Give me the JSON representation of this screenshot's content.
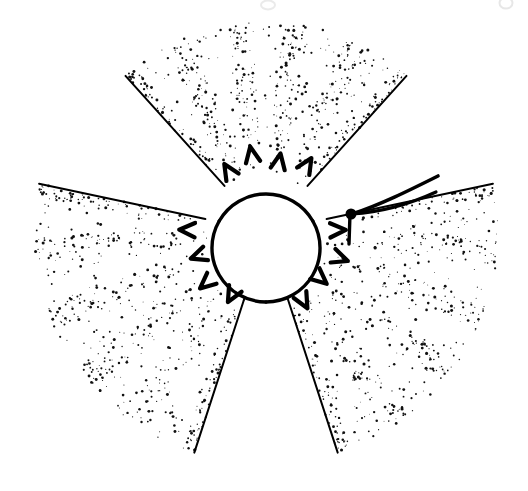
{
  "figure": {
    "domain": "Natural-Image",
    "kind": "scientific-stipple-illustration",
    "description": "Monochrome pen-and-ink stipple drawing of a radially symmetric three-lobed structure with a blank central disc, chevron markings along the inner margins of each lobe, and two slender filaments emerging at the upper right.",
    "background_color": "#ffffff",
    "ink_color": "#000000",
    "canvas": {
      "width": 528,
      "height": 491
    },
    "stipple": {
      "dot_color": "#111111",
      "dot_count": 5200,
      "min_radius": 0.45,
      "max_radius": 1.55,
      "seed": 20240517
    },
    "lobes": [
      {
        "name": "top-lobe",
        "label": "upper lobe",
        "center": [
          266,
          232
        ],
        "start_angle_deg": -132,
        "end_angle_deg": -48,
        "inner_radius": 56,
        "outer_radius": 210,
        "ray_count": 5,
        "ray_half_width_deg": 5.2,
        "corner_points": [
          [
            120,
            70
          ],
          [
            266,
            24
          ],
          [
            412,
            70
          ]
        ]
      },
      {
        "name": "left-lobe",
        "label": "lower-left lobe",
        "center": [
          266,
          232
        ],
        "start_angle_deg": 108,
        "end_angle_deg": 192,
        "inner_radius": 56,
        "outer_radius": 232,
        "ray_count": 5,
        "ray_half_width_deg": 5.2,
        "corner_points": [
          [
            42,
            156
          ],
          [
            14,
            290
          ],
          [
            186,
            452
          ]
        ]
      },
      {
        "name": "right-lobe",
        "label": "lower-right lobe",
        "center": [
          266,
          232
        ],
        "start_angle_deg": -12,
        "end_angle_deg": 72,
        "inner_radius": 56,
        "outer_radius": 232,
        "ray_count": 5,
        "ray_half_width_deg": 5.2,
        "corner_points": [
          [
            504,
            196
          ],
          [
            512,
            300
          ],
          [
            346,
            452
          ]
        ]
      }
    ],
    "central_disc": {
      "name": "central-blank-disc",
      "label": "central blank region",
      "center": [
        266,
        248
      ],
      "radius": 54,
      "fill": "#ffffff",
      "arc_stroke_width": 3.4
    },
    "boundary_arcs": [
      {
        "name": "arc-upper",
        "label": "upper boundary arc",
        "from_angle_deg": -150,
        "to_angle_deg": -30
      },
      {
        "name": "arc-lower-left",
        "label": "lower-left boundary arc",
        "from_angle_deg": 90,
        "to_angle_deg": 210
      },
      {
        "name": "arc-lower-right",
        "label": "lower-right boundary arc",
        "from_angle_deg": -30,
        "to_angle_deg": 90
      }
    ],
    "chevron_marks": {
      "name": "chevron-markings",
      "label": "dark chevron markings at lobe bases",
      "per_lobe": 4,
      "size": 13,
      "stroke_width": 4.2
    },
    "filaments": [
      {
        "name": "filament-upper",
        "label": "upper filament",
        "path": "M 352 214 C 380 205, 410 190, 438 176",
        "stroke_width": 3.6
      },
      {
        "name": "filament-lower",
        "label": "lower filament",
        "path": "M 352 214 C 384 212, 412 203, 436 192",
        "stroke_width": 3.2
      },
      {
        "name": "filament-stem",
        "label": "filament attachment stem",
        "path": "M 350 214 L 349 244",
        "stroke_width": 3.4
      }
    ],
    "filament_node": {
      "name": "filament-node",
      "label": "dark attachment node",
      "center": [
        351,
        214
      ],
      "radius": 5.5
    },
    "scan_artifacts": [
      {
        "name": "scan-artifact-top-center",
        "x": 268,
        "y": 5,
        "width": 14,
        "height": 9,
        "opacity": 0.18
      },
      {
        "name": "scan-artifact-top-right",
        "x": 506,
        "y": 3,
        "width": 13,
        "height": 11,
        "opacity": 0.2
      }
    ]
  }
}
